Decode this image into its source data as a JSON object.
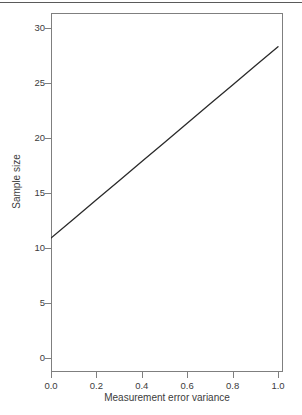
{
  "chart_data": {
    "type": "line",
    "title": "",
    "xlabel": "Measurement error variance",
    "ylabel": "Sample size",
    "xlim": [
      0.0,
      1.0
    ],
    "ylim": [
      0,
      31.2
    ],
    "grid": false,
    "legend": null,
    "xticks": [
      0.0,
      0.2,
      0.4,
      0.6,
      0.8,
      1.0
    ],
    "xtick_labels": [
      "0.0",
      "0.2",
      "0.4",
      "0.6",
      "0.8",
      "1.0"
    ],
    "yticks": [
      0,
      5,
      10,
      15,
      20,
      25,
      30
    ],
    "ytick_labels": [
      "0",
      "5",
      "10",
      "15",
      "20",
      "25",
      "30"
    ],
    "series": [
      {
        "name": "sample size",
        "color": "#2a2a2a",
        "linewidth": 1.3,
        "x": [
          0.0,
          0.1,
          0.2,
          0.3,
          0.4,
          0.5,
          0.6,
          0.7,
          0.8,
          0.9,
          1.0
        ],
        "values": [
          10.9,
          12.64,
          14.38,
          16.12,
          17.86,
          19.6,
          21.34,
          23.08,
          24.82,
          26.56,
          28.3
        ]
      }
    ]
  },
  "figure": {
    "line_color": "#2a2a2a",
    "axis_color": "#7f7f7f",
    "text_color": "#3c3c3c",
    "background": "#ffffff",
    "rule_color": "#5a5a5a"
  }
}
